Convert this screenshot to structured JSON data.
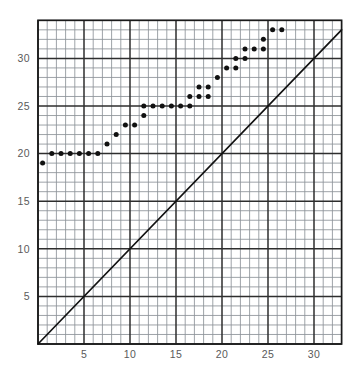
{
  "chart_data": {
    "type": "scatter",
    "title": "",
    "subtitle": "",
    "xlabel": "",
    "ylabel": "",
    "xlim": [
      0,
      33
    ],
    "ylim": [
      0,
      34
    ],
    "grid": true,
    "grid_minor_step": 1,
    "grid_major_step": 5,
    "legend": "none",
    "xticks": [
      5,
      10,
      15,
      20,
      25,
      30
    ],
    "xtick_labels": [
      "5",
      "10",
      "15",
      "20",
      "25",
      "30"
    ],
    "yticks": [
      5,
      10,
      15,
      20,
      25,
      30
    ],
    "ytick_labels": [
      "5",
      "10",
      "15",
      "20",
      "25",
      "30"
    ],
    "series": [
      {
        "name": "data",
        "marker": "filled-circle",
        "color": "#111111",
        "points": [
          [
            0.5,
            19.0
          ],
          [
            1.5,
            20.0
          ],
          [
            2.5,
            20.0
          ],
          [
            3.5,
            20.0
          ],
          [
            4.5,
            20.0
          ],
          [
            5.5,
            20.0
          ],
          [
            6.5,
            20.0
          ],
          [
            7.5,
            21.0
          ],
          [
            8.5,
            22.0
          ],
          [
            9.5,
            23.0
          ],
          [
            10.5,
            23.0
          ],
          [
            11.5,
            24.0
          ],
          [
            11.5,
            25.0
          ],
          [
            12.5,
            25.0
          ],
          [
            13.5,
            25.0
          ],
          [
            14.5,
            25.0
          ],
          [
            15.5,
            25.0
          ],
          [
            16.5,
            25.0
          ],
          [
            16.5,
            26.0
          ],
          [
            17.5,
            26.0
          ],
          [
            17.5,
            27.0
          ],
          [
            18.5,
            26.0
          ],
          [
            18.5,
            27.0
          ],
          [
            19.5,
            28.0
          ],
          [
            20.5,
            29.0
          ],
          [
            21.5,
            30.0
          ],
          [
            21.5,
            29.0
          ],
          [
            22.5,
            30.0
          ],
          [
            22.5,
            31.0
          ],
          [
            23.5,
            31.0
          ],
          [
            24.5,
            31.0
          ],
          [
            24.5,
            32.0
          ],
          [
            25.5,
            33.0
          ],
          [
            26.5,
            33.0
          ]
        ]
      }
    ],
    "reference_line": {
      "name": "identity-line",
      "type": "linear",
      "slope": 1,
      "intercept": 0,
      "color": "#111111",
      "description": "y = x diagonal reference line"
    },
    "colors": {
      "grid_minor": "#8c9298",
      "grid_major": "#2e2e2e",
      "axis": "#1a1a1a",
      "marker": "#111111",
      "tick_text": "#5a5a5a",
      "background": "#ffffff"
    }
  }
}
